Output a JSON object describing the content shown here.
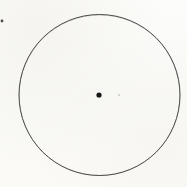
{
  "figure": {
    "title": "Circle with marked centre point",
    "description": "A single large thin-outlined circle drawn on off-white paper with a small solid black dot marking its centre.",
    "canvas": {
      "width": 187,
      "height": 187,
      "background_color": "#fbfbf9",
      "paper_tint": "#f9f9f6"
    },
    "shapes": {
      "circle": {
        "name": "outer-circle",
        "type": "circle",
        "center_x": 99.5,
        "center_y": 95,
        "radius": 80.5,
        "stroke_color": "#3b3b3b",
        "stroke_width": 0.9,
        "fill": "none"
      },
      "center_dot": {
        "name": "center-point",
        "type": "dot",
        "center_x": 99,
        "center_y": 95,
        "radius": 2.6,
        "fill_color": "#171717"
      },
      "edge_speck": {
        "name": "left-edge-speck",
        "type": "dot",
        "center_x": 2,
        "center_y": 21,
        "radius": 1.4,
        "fill_color": "#4a4a4a"
      },
      "faint_speck": {
        "name": "faint-speck",
        "type": "dot",
        "center_x": 119,
        "center_y": 95,
        "radius": 1.0,
        "fill_color": "#c9c9c6"
      }
    },
    "labels": {
      "circle_label": "",
      "center_label": "",
      "radius_label": ""
    }
  }
}
